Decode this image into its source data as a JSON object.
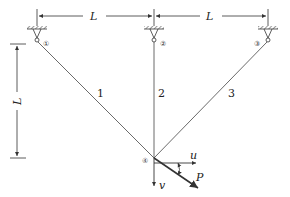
{
  "diagram": {
    "type": "three-bar truss",
    "dimensions": {
      "top_left": "L",
      "top_right": "L",
      "vertical": "L"
    },
    "nodes": [
      {
        "id": "1",
        "label": "①",
        "x": 37,
        "y": 42,
        "support": "pin"
      },
      {
        "id": "2",
        "label": "②",
        "x": 154,
        "y": 42,
        "support": "pin"
      },
      {
        "id": "3",
        "label": "③",
        "x": 268,
        "y": 42,
        "support": "pin"
      },
      {
        "id": "4",
        "label": "④",
        "x": 154,
        "y": 158,
        "support": "free"
      }
    ],
    "members": [
      {
        "label": "1",
        "from": "1",
        "to": "4"
      },
      {
        "label": "2",
        "from": "2",
        "to": "4"
      },
      {
        "label": "3",
        "from": "3",
        "to": "4"
      }
    ],
    "load": {
      "label": "P"
    },
    "displacements": {
      "horizontal": "u",
      "vertical": "v"
    },
    "colors": {
      "line": "#333333",
      "background": "#ffffff"
    }
  }
}
